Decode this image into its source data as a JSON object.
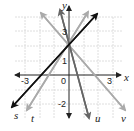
{
  "diagram": {
    "type": "coordinate-plane-lines",
    "axes": {
      "x_label": "x",
      "y_label": "y",
      "x_ticks": [
        {
          "value": -3,
          "label": "-3"
        },
        {
          "value": 0,
          "label": "0"
        },
        {
          "value": 3,
          "label": "3"
        }
      ],
      "y_ticks": [
        {
          "value": 3,
          "label": "3"
        },
        {
          "value": 1,
          "label": "1"
        },
        {
          "value": -2,
          "label": "-2"
        }
      ],
      "x_range": [
        -4,
        4
      ],
      "y_range": [
        -3,
        5
      ],
      "grid": true
    },
    "lines": [
      {
        "name": "s",
        "label": "s",
        "equation": "y = x + 2",
        "slope": 1,
        "intercept": 2,
        "color": "#111111"
      },
      {
        "name": "t",
        "label": "t",
        "equation": "y = 2x + 2",
        "slope": 2,
        "intercept": 2,
        "color": "#aaaaaa"
      },
      {
        "name": "u",
        "label": "u",
        "equation": "y = -4x + 2",
        "slope": -4,
        "intercept": 2,
        "color": "#666666"
      },
      {
        "name": "v",
        "label": "v",
        "equation": "y = -x + 2",
        "slope": -1,
        "intercept": 2,
        "color": "#aaaaaa"
      }
    ],
    "intersection": {
      "x": 0,
      "y": 2
    }
  },
  "labels": {
    "x_axis": "x",
    "y_axis": "y",
    "tick_neg3": "-3",
    "tick_0": "0",
    "tick_3x": "3",
    "tick_3y": "3",
    "tick_1y": "1",
    "tick_neg2y": "-2",
    "line_s": "s",
    "line_t": "t",
    "line_u": "u",
    "line_v": "v"
  }
}
